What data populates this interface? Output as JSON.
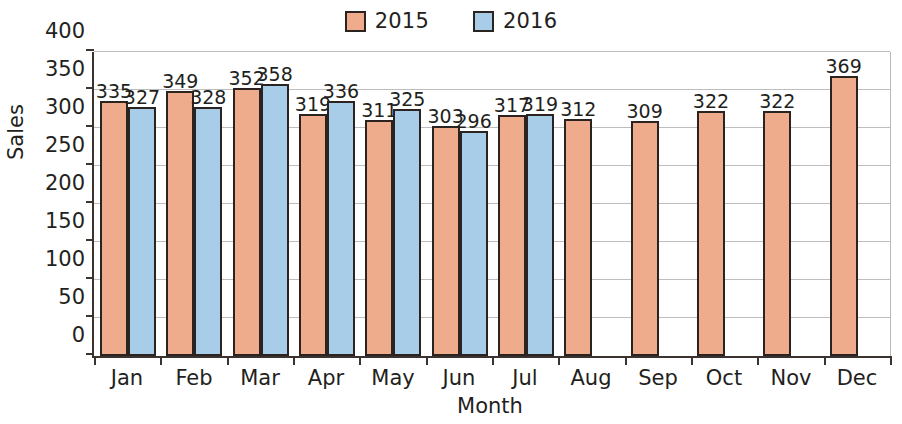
{
  "chart_data": {
    "type": "bar",
    "title": "",
    "xlabel": "Month",
    "ylabel": "Sales",
    "categories": [
      "Jan",
      "Feb",
      "Mar",
      "Apr",
      "May",
      "Jun",
      "Jul",
      "Aug",
      "Sep",
      "Oct",
      "Nov",
      "Dec"
    ],
    "series": [
      {
        "name": "2015",
        "color": "#efac8c",
        "values": [
          335,
          349,
          352,
          319,
          311,
          303,
          317,
          312,
          309,
          322,
          322,
          369
        ]
      },
      {
        "name": "2016",
        "color": "#a8cde8",
        "values": [
          327,
          328,
          358,
          336,
          325,
          296,
          319,
          null,
          null,
          null,
          null,
          null
        ]
      }
    ],
    "ylim": [
      0,
      400
    ],
    "yticks": [
      0,
      50,
      100,
      150,
      200,
      250,
      300,
      350,
      400
    ],
    "ytick_labels": [
      "0",
      "50",
      "100",
      "150",
      "200",
      "250",
      "300",
      "350",
      "400"
    ],
    "grid": true,
    "legend_position": "top-center",
    "data_labels": true
  },
  "legend": {
    "entries": [
      {
        "label": "2015",
        "swatch": "legend-swatch-2015"
      },
      {
        "label": "2016",
        "swatch": "legend-swatch-2016"
      }
    ]
  },
  "axes": {
    "y_title": "Sales",
    "x_title": "Month"
  },
  "colors": {
    "series_2015": "#efac8c",
    "series_2016": "#a8cde8",
    "bar_outline": "#2b2320",
    "axis": "#3a3330",
    "gridline": "#bdbdbd",
    "text": "#231f20",
    "background": "#ffffff"
  }
}
